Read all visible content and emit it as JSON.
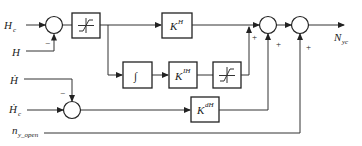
{
  "diagram": {
    "type": "control block diagram",
    "inputs": {
      "hc": {
        "main": "H",
        "sub": "c"
      },
      "h": {
        "main": "H"
      },
      "hdot": {
        "main": "Ḣ"
      },
      "hcdot": {
        "main": "Ḣ",
        "sub": "c"
      },
      "ny_open": {
        "main": "n",
        "sub": "y_open"
      }
    },
    "output": {
      "main": "N",
      "sub": "yc"
    },
    "blocks": {
      "sat1": {
        "symbol": "saturation"
      },
      "kh": {
        "main": "K",
        "sup": "H"
      },
      "integrator": {
        "symbol": "∫"
      },
      "kih": {
        "main": "K",
        "sup": "IH"
      },
      "sat2": {
        "symbol": "saturation"
      },
      "kdh": {
        "main": "K",
        "sup": "dH"
      }
    },
    "signs": {
      "sum1_h": "−",
      "sum4_hdot": "−",
      "sum2_integral": "+",
      "sum2_kdh": "+",
      "sum3_ny": "+"
    }
  }
}
